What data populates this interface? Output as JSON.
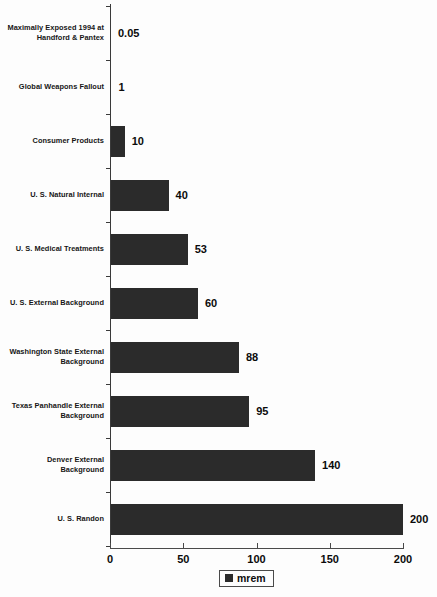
{
  "chart_data": {
    "type": "bar",
    "orientation": "horizontal",
    "title": "",
    "xlabel": "",
    "ylabel": "",
    "xlim": [
      0,
      200
    ],
    "grid": false,
    "legend_position": "bottom",
    "categories": [
      "Maximally Exposed 1994 at Handford & Pantex",
      "Global Weapons Fallout",
      "Consumer Products",
      "U. S. Natural Internal",
      "U. S. Medical Treatments",
      "U. S. External Background",
      "Washington State External Background",
      "Texas Panhandle External Background",
      "Denver External Background",
      "U. S. Randon"
    ],
    "values": [
      0.05,
      1,
      10,
      40,
      53,
      60,
      88,
      95,
      140,
      200
    ],
    "value_labels": [
      "0.05",
      "1",
      "10",
      "40",
      "53",
      "60",
      "88",
      "95",
      "140",
      "200"
    ],
    "series": [
      {
        "name": "mrem",
        "values": [
          0.05,
          1,
          10,
          40,
          53,
          60,
          88,
          95,
          140,
          200
        ],
        "color": "#2b2b2b"
      }
    ],
    "xticks": [
      0,
      50,
      100,
      150,
      200
    ],
    "xtick_labels": [
      "0",
      "50",
      "100",
      "150",
      "200"
    ]
  },
  "legend": {
    "entries": [
      {
        "label": "mrem",
        "color": "#2b2b2b",
        "marker": "square-marker"
      }
    ]
  },
  "axis": {
    "line_color": "#3a3a3a",
    "tick_color": "#4a4a4a"
  },
  "colors": {
    "bar_fill": "#2b2b2b",
    "background": "#fdfdfd",
    "text": "#0b0b0b"
  }
}
